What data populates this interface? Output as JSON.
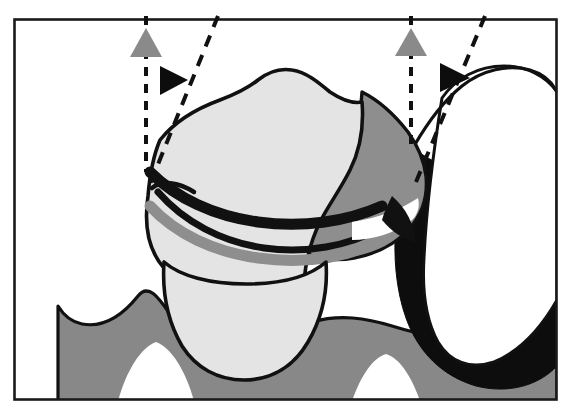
{
  "page": {
    "page_number_label": "156",
    "background_color": "#ffffff"
  },
  "figure": {
    "caption": "",
    "frame": {
      "name": "figure-border",
      "x": 13,
      "y": 18,
      "width": 545,
      "height": 383,
      "stroke_color": "#1a1a1a",
      "stroke_width": 2.5
    },
    "palette": {
      "ink": "#111111",
      "outline": "#1a1a1a",
      "enamel_light": "#e4e4e4",
      "dentin_mid": "#8e8e8e",
      "gray_marker": "#8a8a8a",
      "black_marker": "#0d0d0d",
      "white": "#ffffff",
      "bone_gray": "#888888"
    },
    "markers": [
      {
        "id": "left-vertical-marker",
        "type": "triangle-up",
        "color": "#8a8a8a",
        "x": 146,
        "y": 44,
        "size": 22,
        "label": "left gray reference triangle"
      },
      {
        "id": "left-oblique-marker",
        "type": "triangle-right",
        "color": "#0d0d0d",
        "x": 172,
        "y": 80,
        "size": 20,
        "label": "left black reference triangle"
      },
      {
        "id": "right-vertical-marker",
        "type": "triangle-up",
        "color": "#8a8a8a",
        "x": 411,
        "y": 43,
        "size": 22,
        "label": "right gray reference triangle"
      },
      {
        "id": "right-oblique-marker",
        "type": "triangle-right",
        "color": "#0d0d0d",
        "x": 453,
        "y": 77,
        "size": 20,
        "label": "right black reference triangle"
      }
    ],
    "guide_lines": [
      {
        "id": "left-vertical-dashed",
        "orientation": "vertical",
        "x1": 146,
        "y1": 18,
        "x2": 146,
        "y2": 172
      },
      {
        "id": "left-oblique-dashed",
        "orientation": "oblique",
        "x1": 216,
        "y1": 18,
        "x2": 148,
        "y2": 180
      },
      {
        "id": "right-vertical-dashed",
        "orientation": "vertical",
        "x1": 411,
        "y1": 18,
        "x2": 411,
        "y2": 150
      },
      {
        "id": "right-oblique-dashed",
        "orientation": "oblique",
        "x1": 483,
        "y1": 18,
        "x2": 415,
        "y2": 178
      }
    ],
    "regions": [
      {
        "id": "crown-enamel",
        "fill": "#e4e4e4",
        "label": "crown enamel cap"
      },
      {
        "id": "distal-dentin-wedge",
        "fill": "#8e8e8e",
        "label": "shaded dentin wedge"
      },
      {
        "id": "pulp-band",
        "fill": "#8e8e8e",
        "label": "interior gray band"
      },
      {
        "id": "adjacent-tooth",
        "fill": "#ffffff",
        "label": "adjacent tooth crown"
      },
      {
        "id": "interproximal-shadow",
        "fill": "#0d0d0d",
        "label": "black interproximal shadow"
      },
      {
        "id": "alveolar-bone-band",
        "fill": "#888888",
        "label": "wavy alveolar bone band"
      }
    ]
  }
}
